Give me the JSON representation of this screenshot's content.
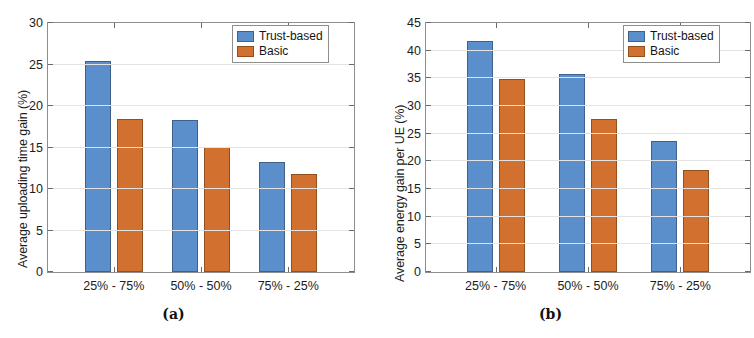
{
  "figure": {
    "panels": [
      {
        "caption": "(a)",
        "chart_index": 0
      },
      {
        "caption": "(b)",
        "chart_index": 1
      }
    ]
  },
  "colors": {
    "series_trust_based": "#5b8fcb",
    "series_basic": "#d1702f",
    "axis": "#8e8e8e",
    "grid": "#e3e3e3",
    "text": "#1c1c1c",
    "background": "#ffffff"
  },
  "chart_data": [
    {
      "type": "bar",
      "title": "",
      "xlabel": "",
      "ylabel": "Average uploading time gain (%)",
      "categories": [
        "25% - 75%",
        "50% - 50%",
        "75% - 25%"
      ],
      "series": [
        {
          "name": "Trust-based",
          "color": "#5b8fcb",
          "values": [
            25.4,
            18.3,
            13.2
          ]
        },
        {
          "name": "Basic",
          "color": "#d1702f",
          "values": [
            18.4,
            15.1,
            11.8
          ]
        }
      ],
      "ylim": [
        0,
        30
      ],
      "yticks": [
        0,
        5,
        10,
        15,
        20,
        25,
        30
      ],
      "ytick_labels": [
        "0",
        "5",
        "10",
        "15",
        "20",
        "25",
        "30"
      ],
      "grid": true,
      "legend_position": "top-right",
      "legend_entries": [
        "Trust-based",
        "Basic"
      ]
    },
    {
      "type": "bar",
      "title": "",
      "xlabel": "",
      "ylabel": "Average energy gain per UE (%)",
      "categories": [
        "25% - 75%",
        "50% - 50%",
        "75% - 25%"
      ],
      "series": [
        {
          "name": "Trust-based",
          "color": "#5b8fcb",
          "values": [
            41.7,
            35.8,
            23.6
          ]
        },
        {
          "name": "Basic",
          "color": "#d1702f",
          "values": [
            34.8,
            27.7,
            18.4
          ]
        }
      ],
      "ylim": [
        0,
        45
      ],
      "yticks": [
        0,
        5,
        10,
        15,
        20,
        25,
        30,
        35,
        40,
        45
      ],
      "ytick_labels": [
        "0",
        "5",
        "10",
        "15",
        "20",
        "25",
        "30",
        "35",
        "40",
        "45"
      ],
      "grid": true,
      "legend_position": "top-right",
      "legend_entries": [
        "Trust-based",
        "Basic"
      ]
    }
  ]
}
